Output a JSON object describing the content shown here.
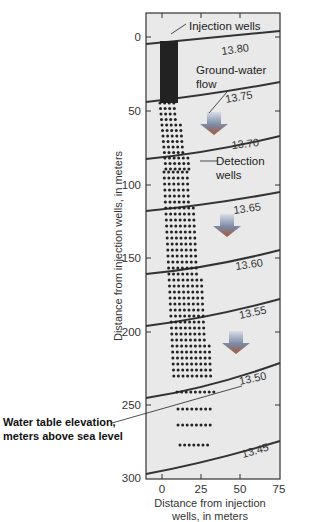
{
  "chart_data": {
    "type": "scatter",
    "title": "",
    "xlabel": "Distance from injection wells, in meters",
    "ylabel": "Distance from injection wells, in meters",
    "xlim": [
      -10,
      75
    ],
    "ylim": [
      300,
      -17
    ],
    "xticks": [
      "0",
      "25",
      "50",
      "75"
    ],
    "yticks": [
      "0",
      "50",
      "100",
      "150",
      "200",
      "250",
      "300"
    ],
    "contours": [
      {
        "label": "13.80",
        "value": 13.8
      },
      {
        "label": "13.75",
        "value": 13.75
      },
      {
        "label": "13.70",
        "value": 13.7
      },
      {
        "label": "13.65",
        "value": 13.65
      },
      {
        "label": "13.60",
        "value": 13.6
      },
      {
        "label": "13.55",
        "value": 13.55
      },
      {
        "label": "13.50",
        "value": 13.5
      },
      {
        "label": "13.45",
        "value": 13.45
      }
    ],
    "annotations": {
      "injection": "Injection wells",
      "flow_line1": "Ground-water",
      "flow_line2": "flow",
      "detect_line1": "Detection",
      "detect_line2": "wells",
      "wt_line1": "Water table elevation,",
      "wt_line2": "meters above sea level"
    },
    "xlabel_line1": "Distance from injection",
    "xlabel_line2": "wells, in meters",
    "grid": false,
    "legend": "none"
  }
}
